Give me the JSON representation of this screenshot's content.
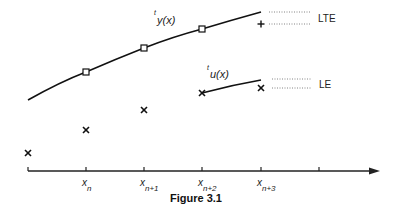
{
  "figure": {
    "caption": "Figure 3.1",
    "curves": {
      "y_label_sup": "t",
      "y_label": "y(x)",
      "u_label_sup": "t",
      "u_label": "u(x)"
    },
    "legend": {
      "lte": "LTE",
      "le": "LE"
    },
    "axis_ticks": [
      {
        "base": "x",
        "sub": "n"
      },
      {
        "base": "x",
        "sub": "n+1"
      },
      {
        "base": "x",
        "sub": "n+2"
      },
      {
        "base": "x",
        "sub": "n+3"
      }
    ],
    "markers": {
      "true_solution_points": "square",
      "numerical_points": "cross",
      "exact_next_point": "plus"
    }
  }
}
